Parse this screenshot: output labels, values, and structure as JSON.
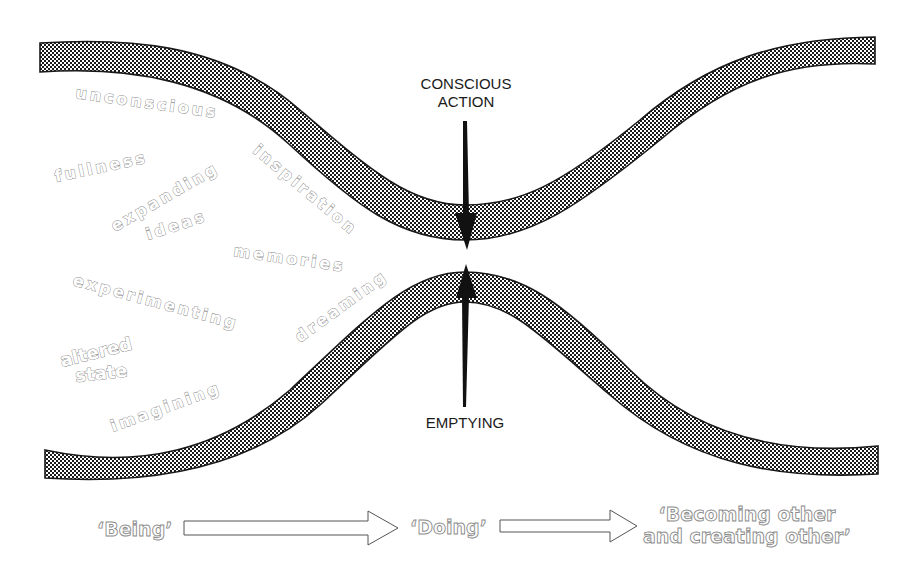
{
  "diagram": {
    "title": "",
    "channel": {
      "description": "Two hatched wavy bands forming a channel that narrows at the centre",
      "pattern_color": "#1a1a1a",
      "background_color": "#ffffff"
    },
    "center_labels": {
      "top_line1": "CONSCIOUS",
      "top_line2": "ACTION",
      "bottom": "EMPTYING"
    },
    "left_words": [
      {
        "text": "unconscious",
        "angle": 8
      },
      {
        "text": "fullness",
        "angle": -12
      },
      {
        "text": "expanding",
        "angle": -30
      },
      {
        "text": "ideas",
        "angle": -18
      },
      {
        "text": "inspiration",
        "angle": 40
      },
      {
        "text": "memories",
        "angle": 8
      },
      {
        "text": "experimenting",
        "angle": 15
      },
      {
        "text": "dreaming",
        "angle": -36
      },
      {
        "text": "altered",
        "angle": -14
      },
      {
        "text": "state",
        "angle": -6
      },
      {
        "text": "imagining",
        "angle": -20
      }
    ],
    "flow": {
      "stage1": "‘Being’",
      "stage2": "‘Doing’",
      "stage3_line1": "‘Becoming other",
      "stage3_line2": "and creating other’"
    },
    "icons": {
      "down_arrow": "arrow-down-icon",
      "up_arrow": "arrow-up-icon",
      "flow_arrow": "arrow-right-icon"
    }
  }
}
